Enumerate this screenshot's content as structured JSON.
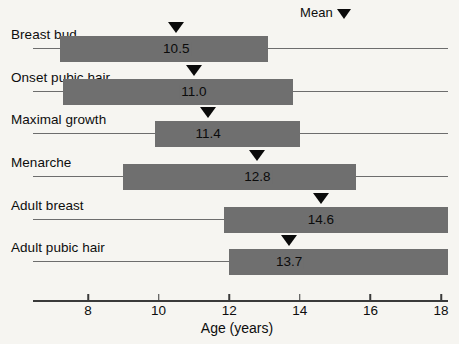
{
  "chart_data": {
    "type": "bar",
    "title": "",
    "xlabel": "Age (years)",
    "ylabel": "",
    "xlim": [
      6.44,
      18.47
    ],
    "xticks": [
      8,
      10,
      12,
      14,
      16,
      18
    ],
    "xtick_labels": [
      "8",
      "10",
      "12",
      "14",
      "16",
      "18"
    ],
    "grid": false,
    "orientation": "horizontal",
    "legend": {
      "label": "Mean",
      "marker": "down-triangle",
      "position": "top-right"
    },
    "categories": [
      "Breast bud",
      "Onset pubic hair",
      "Maximal growth",
      "Menarche",
      "Adult breast",
      "Adult pubic hair"
    ],
    "series": [
      {
        "name": "Age range (bar) with mean marker",
        "points": [
          {
            "category": "Breast bud",
            "range_start": 7.2,
            "range_end": 13.1,
            "mean": 10.5,
            "mean_label": "10.5"
          },
          {
            "category": "Onset pubic hair",
            "range_start": 7.3,
            "range_end": 13.8,
            "mean": 11.0,
            "mean_label": "11.0"
          },
          {
            "category": "Maximal growth",
            "range_start": 9.9,
            "range_end": 14.0,
            "mean": 11.4,
            "mean_label": "11.4"
          },
          {
            "category": "Menarche",
            "range_start": 9.0,
            "range_end": 15.6,
            "mean": 12.8,
            "mean_label": "12.8"
          },
          {
            "category": "Adult breast",
            "range_start": 11.85,
            "range_end": 18.5,
            "mean": 14.6,
            "mean_label": "14.6"
          },
          {
            "category": "Adult pubic hair",
            "range_start": 12.0,
            "range_end": 18.5,
            "mean": 13.7,
            "mean_label": "13.7"
          }
        ]
      }
    ],
    "colors": {
      "bar": "#6f6f6f",
      "marker": "#0a0a0a",
      "axis": "#3a3a3a",
      "rowline": "#6d6d6d",
      "background": "#f6f5f1"
    }
  }
}
